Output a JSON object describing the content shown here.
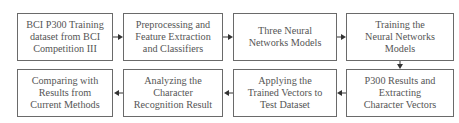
{
  "diagram": {
    "type": "flowchart",
    "nodes": [
      {
        "id": "n1",
        "label": "BCI P300 Training\ndataset from BCI\nCompetition III"
      },
      {
        "id": "n2",
        "label": "Preprocessing and\nFeature Extraction\nand Classifiers"
      },
      {
        "id": "n3",
        "label": "Three Neural\nNetworks Models"
      },
      {
        "id": "n4",
        "label": "Training the\nNeural Networks\nModels"
      },
      {
        "id": "n5",
        "label": "P300 Results and\nExtracting\nCharacter Vectors"
      },
      {
        "id": "n6",
        "label": "Applying the\nTrained Vectors to\nTest Dataset"
      },
      {
        "id": "n7",
        "label": "Analyzing the\nCharacter\nRecognition Result"
      },
      {
        "id": "n8",
        "label": "Comparing with\nResults from\nCurrent Methods"
      }
    ],
    "edges": [
      {
        "from": "n1",
        "to": "n2"
      },
      {
        "from": "n2",
        "to": "n3"
      },
      {
        "from": "n3",
        "to": "n4"
      },
      {
        "from": "n4",
        "to": "n5"
      },
      {
        "from": "n5",
        "to": "n6"
      },
      {
        "from": "n6",
        "to": "n7"
      },
      {
        "from": "n7",
        "to": "n8"
      }
    ],
    "colors": {
      "border": "#6a6a6a",
      "text": "#555555",
      "arrow": "#333333"
    }
  }
}
